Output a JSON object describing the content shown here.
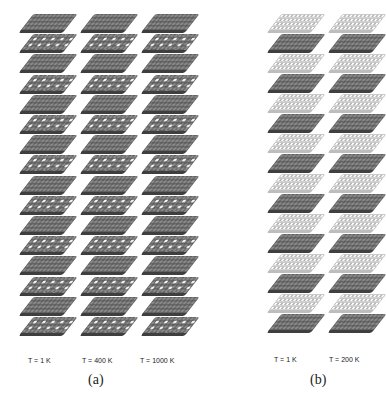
{
  "figure": {
    "panel_a": {
      "label": "(a)",
      "columns": [
        {
          "temperature_label": "T = 1 K"
        },
        {
          "temperature_label": "T = 400 K"
        },
        {
          "temperature_label": "T = 1000 K"
        }
      ],
      "layers_per_column": 16,
      "layer_style": "dark gray spheres with white vacancy/adatom spots on alternating layers"
    },
    "panel_b": {
      "label": "(b)",
      "columns": [
        {
          "temperature_label": "T = 1 K"
        },
        {
          "temperature_label": "T = 200 K"
        }
      ],
      "layers_per_column": 16,
      "layer_style": "alternating light (white spheres) and dark gray layers"
    },
    "colors": {
      "dark_layer": "#5e5e5e",
      "light_layer": "#d8d8d8",
      "spot": "#ffffff",
      "text": "#222222"
    }
  }
}
